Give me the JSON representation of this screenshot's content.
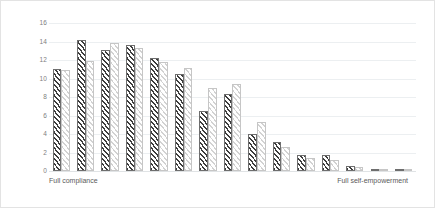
{
  "chart_data": {
    "type": "bar",
    "title": "",
    "subtitle": "",
    "xlabel": "",
    "ylabel": "",
    "ylim": [
      0,
      16
    ],
    "ytick_step": 2,
    "yticks": [
      16,
      14,
      12,
      10,
      8,
      6,
      4,
      2,
      0
    ],
    "ytick_labels": [
      "16",
      "14",
      "12",
      "10",
      "8",
      "6",
      "4",
      "2",
      "0"
    ],
    "grid": true,
    "grid_axis": "y",
    "legend": false,
    "legend_position": "none",
    "categories": [
      "1",
      "2",
      "3",
      "4",
      "5",
      "6",
      "7",
      "8",
      "9",
      "10",
      "11",
      "12",
      "13",
      "14",
      "15"
    ],
    "series": [
      {
        "name": "Series A",
        "style": "dark-diagonal-hatch",
        "color": "#3d3d3d",
        "values": [
          11.0,
          14.2,
          13.1,
          13.6,
          12.2,
          10.5,
          6.5,
          8.3,
          4.0,
          3.1,
          1.7,
          1.7,
          0.5,
          0.2,
          0.2
        ]
      },
      {
        "name": "Series B",
        "style": "light-diagonal-hatch",
        "color": "#d2d2d2",
        "values": [
          10.9,
          11.9,
          13.8,
          13.3,
          11.8,
          11.1,
          9.0,
          9.4,
          5.3,
          2.6,
          1.4,
          1.2,
          0.4,
          0.2,
          0.2
        ]
      }
    ],
    "axis_end_labels": {
      "left": "Full compliance",
      "right": "Full self-empowerment"
    },
    "colors": {
      "gridline": "#eceff1",
      "baseline": "#e0e3e5",
      "tick_text": "#808080",
      "caption_text": "#5a5a5a",
      "card_border": "#e3e3e3",
      "background": "#ffffff"
    }
  }
}
